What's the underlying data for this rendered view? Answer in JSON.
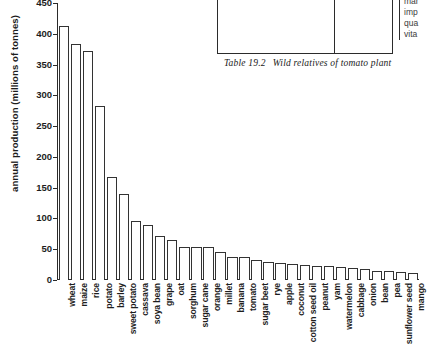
{
  "table_fragment": {
    "ghost_text": "(continued)",
    "right_column_lines": [
      "mar",
      "imp",
      "qua",
      "vita"
    ],
    "caption_number": "Table 19.2",
    "caption_text": "Wild relatives of tomato plant"
  },
  "chart_data": {
    "type": "bar",
    "title": "",
    "xlabel": "",
    "ylabel": "annual production (millions of tonnes)",
    "ylim": [
      0,
      450
    ],
    "yticks": [
      0,
      50,
      100,
      150,
      200,
      250,
      300,
      350,
      400,
      450
    ],
    "grid": false,
    "legend": "none",
    "categories": [
      "wheat",
      "maize",
      "rice",
      "potato",
      "barley",
      "sweet potato",
      "cassava",
      "soya bean",
      "grape",
      "oat",
      "sorghum",
      "sugar cane",
      "orange",
      "millet",
      "banana",
      "tomato",
      "sugar beet",
      "rye",
      "apple",
      "coconut",
      "cotton seed oil",
      "peanut",
      "yam",
      "watermelon",
      "cabbage",
      "onion",
      "bean",
      "pea",
      "sunflower seed",
      "mango"
    ],
    "values": [
      413,
      383,
      372,
      282,
      168,
      139,
      96,
      90,
      72,
      65,
      54,
      54,
      54,
      45,
      37,
      37,
      33,
      30,
      27,
      26,
      24,
      23,
      22,
      21,
      19,
      18,
      15,
      14,
      13,
      12
    ],
    "bar_color": "#ffffff",
    "bar_edge_color": "#333333",
    "axis_color": "#2b2b2b"
  }
}
